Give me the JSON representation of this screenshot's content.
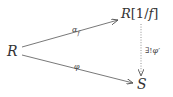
{
  "diagram": {
    "type": "commutative-diagram",
    "nodes": {
      "source": {
        "id": "R",
        "label": "R"
      },
      "localization": {
        "id": "R_f",
        "label_main": "R",
        "label_bracket": "[1/",
        "label_var": "f",
        "label_close": "]",
        "full": "R[1/f]"
      },
      "target": {
        "id": "S",
        "label": "S"
      }
    },
    "edges": [
      {
        "from": "R",
        "to": "R[1/f]",
        "label_main": "α",
        "label_sub": "f",
        "full": "α_f",
        "style": "solid"
      },
      {
        "from": "R",
        "to": "S",
        "label": "φ",
        "style": "solid"
      },
      {
        "from": "R[1/f]",
        "to": "S",
        "label_prefix": "∃!",
        "label_main": "φ",
        "label_prime": "′",
        "full": "∃!φ′",
        "style": "dotted"
      }
    ],
    "colors": {
      "stroke": "#555555",
      "text": "#333333",
      "background": "#ffffff"
    }
  }
}
